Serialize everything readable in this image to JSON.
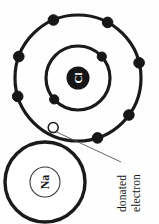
{
  "diagram": {
    "type": "bohr-model-ionic-bond",
    "background_color": "#fefefe",
    "stroke_color": "#1a1a1a",
    "atoms": [
      {
        "id": "chlorine",
        "symbol": "Cl",
        "symbol_color": "#ffffff",
        "nucleus_fill": "#161616",
        "center": {
          "x": 78,
          "y": 78
        },
        "nucleus_radius": 11.5,
        "shells": [
          {
            "name": "inner-shell",
            "radius": 32,
            "stroke_width": 3.2,
            "electrons": [
              {
                "name": "electron-inner-1",
                "angle_deg": -42,
                "fill": "#161616",
                "radius": 4.6
              },
              {
                "name": "electron-inner-2",
                "angle_deg": 138,
                "fill": "#161616",
                "radius": 4.6
              }
            ]
          },
          {
            "name": "outer-shell",
            "radius": 63,
            "stroke_width": 3.2,
            "electrons": [
              {
                "name": "electron-outer-1",
                "angle_deg": -113,
                "fill": "#161616",
                "radius": 5.2
              },
              {
                "name": "electron-outer-2",
                "angle_deg": -62,
                "fill": "#161616",
                "radius": 5.2
              },
              {
                "name": "electron-outer-3",
                "angle_deg": -14,
                "fill": "#161616",
                "radius": 5.2
              },
              {
                "name": "electron-outer-4",
                "angle_deg": 36,
                "fill": "#161616",
                "radius": 5.2
              },
              {
                "name": "electron-outer-5",
                "angle_deg": 72,
                "fill": "#161616",
                "radius": 5.2
              },
              {
                "name": "electron-outer-6",
                "angle_deg": 163,
                "fill": "#161616",
                "radius": 5.2
              },
              {
                "name": "electron-outer-7",
                "angle_deg": -160,
                "fill": "#161616",
                "radius": 5.2
              },
              {
                "name": "donated-electron",
                "angle_deg": 128,
                "fill": "#ffffff",
                "radius": 5.0,
                "highlight": true
              }
            ]
          }
        ]
      },
      {
        "id": "sodium",
        "symbol": "Na",
        "symbol_color": "#1a1a1a",
        "center": {
          "x": 45,
          "y": 182
        },
        "outer_radius": 40,
        "outer_stroke_width": 3.4,
        "nucleus_radius": 15,
        "nucleus_stroke_width": 1.1
      }
    ],
    "callout": {
      "name": "donated-electron-callout",
      "line1": "donated",
      "line2": "electron",
      "rotation_deg": -90,
      "leader_from": {
        "x": 55,
        "y": 131
      },
      "leader_to": {
        "x": 121,
        "y": 162
      },
      "leader_width": 0.9,
      "text_anchor": {
        "x": 122,
        "y": 211
      }
    }
  }
}
